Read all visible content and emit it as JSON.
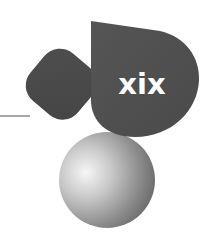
{
  "illustration": {
    "numeral": "xix",
    "shapes": [
      {
        "name": "rule-line",
        "color": "#6e6e6e"
      },
      {
        "name": "rounded-square",
        "color": "#4a4a4a"
      },
      {
        "name": "leaf",
        "color": "#505050"
      },
      {
        "name": "sphere",
        "highlight": "#f2f2f2",
        "shadow": "#6a6a6a"
      }
    ],
    "colors": {
      "background": "#ffffff",
      "dark_shape": "#4c4c4c",
      "numeral_text": "#ffffff"
    }
  }
}
